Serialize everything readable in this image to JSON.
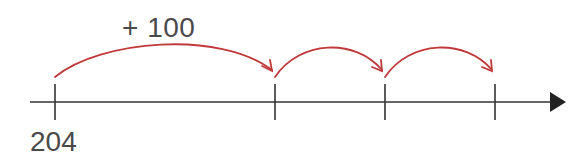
{
  "diagram": {
    "type": "number-line",
    "start_label": "204",
    "jump_label": "+ 100",
    "tick_count": 4,
    "jumps": 3,
    "labeled_ticks": [
      "204",
      "",
      "",
      ""
    ],
    "colors": {
      "axis": "#333333",
      "jump_arrow": "#c0393b",
      "text": "#4a4a4a",
      "background": "#ffffff"
    }
  }
}
